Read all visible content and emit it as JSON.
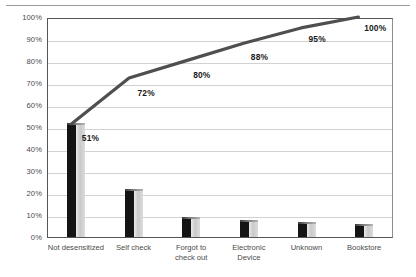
{
  "chart_data": {
    "type": "bar",
    "title": "",
    "subtitle": "",
    "xlabel": "",
    "ylabel": "",
    "ylim": [
      0,
      100
    ],
    "grid": true,
    "legend": "none",
    "categories": [
      "Not desensitized",
      "Self check",
      "Forgot to\ncheck out",
      "Electronic\nDevice",
      "Unknown",
      "Bookstore"
    ],
    "ytick_labels": [
      "100%",
      "90%",
      "80%",
      "70%",
      "60%",
      "50%",
      "40%",
      "30%",
      "20%",
      "10%",
      "0%"
    ],
    "ytick_values": [
      100,
      90,
      80,
      70,
      60,
      50,
      40,
      30,
      20,
      10,
      0
    ],
    "series": [
      {
        "name": "Frequency",
        "type": "bar",
        "values": [
          51,
          21,
          8,
          7,
          6,
          5
        ]
      },
      {
        "name": "Cumulative",
        "type": "line",
        "values": [
          51,
          72,
          80,
          88,
          95,
          100
        ],
        "point_labels": [
          "51%",
          "72%",
          "80%",
          "88%",
          "95%",
          "100%"
        ],
        "color": "#4f4f4f"
      }
    ],
    "colors": {
      "bar_front": "#141414",
      "bar_side": "#c9c9c9",
      "line": "#4f4f4f",
      "gridline": "#d2d2d2",
      "axis": "#555555",
      "tick_text": "#4a4a4a",
      "label_text": "#1a1a1a"
    }
  }
}
